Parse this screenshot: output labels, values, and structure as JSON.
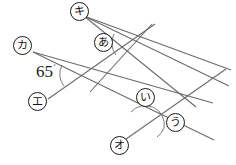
{
  "figure": {
    "background_color": "#ffffff",
    "line_color": "#6b6b6b",
    "label_text_color": "#111111",
    "known_angle": {
      "value": "65",
      "degree_symbol": "˚",
      "x": 36,
      "y": 63
    },
    "labels": [
      {
        "id": "ki",
        "text": "キ",
        "x": 70,
        "y": 2,
        "interactable": false
      },
      {
        "id": "ka",
        "text": "カ",
        "x": 13,
        "y": 36,
        "interactable": false
      },
      {
        "id": "a",
        "text": "あ",
        "x": 94,
        "y": 33,
        "interactable": false
      },
      {
        "id": "e",
        "text": "エ",
        "x": 28,
        "y": 92,
        "interactable": false
      },
      {
        "id": "i",
        "text": "い",
        "x": 136,
        "y": 88,
        "interactable": false
      },
      {
        "id": "u",
        "text": "う",
        "x": 166,
        "y": 113,
        "interactable": false
      },
      {
        "id": "o",
        "text": "オ",
        "x": 110,
        "y": 136,
        "interactable": false
      }
    ],
    "lines": [
      {
        "id": "line-ka-to-lower-right",
        "x1": 33,
        "y1": 52,
        "x2": 213,
        "y2": 103
      },
      {
        "id": "line-a-upper-parallel",
        "x1": 84,
        "y1": 63,
        "x2": 231,
        "y2": 70
      },
      {
        "id": "line-ki-transversal",
        "x1": 84,
        "y1": 16,
        "x2": 196,
        "y2": 107
      },
      {
        "id": "line-e-transversal",
        "x1": 49,
        "y1": 99,
        "x2": 178,
        "y2": 144
      }
    ],
    "intersections": [
      {
        "id": "intersection-left",
        "x": 78,
        "y": 73
      },
      {
        "id": "intersection-upper-right",
        "x": 130,
        "y": 42
      },
      {
        "id": "intersection-far-right",
        "x": 199,
        "y": 88
      },
      {
        "id": "intersection-bottom",
        "x": 148,
        "y": 122
      }
    ],
    "angle_arcs": [
      {
        "id": "arc-65-degrees",
        "cx": 78,
        "cy": 73,
        "r": 20
      },
      {
        "id": "arc-a",
        "cx": 130,
        "cy": 42,
        "r": 20
      },
      {
        "id": "arc-i",
        "cx": 148,
        "cy": 122,
        "r": 19
      },
      {
        "id": "arc-u",
        "cx": 148,
        "cy": 122,
        "r": 19
      }
    ]
  }
}
